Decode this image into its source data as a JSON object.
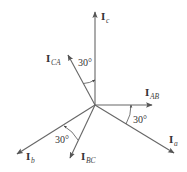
{
  "diagram": {
    "type": "phasor-diagram",
    "origin": {
      "x": 95,
      "y": 105
    },
    "line_color": "#555555",
    "phasors": [
      {
        "id": "Ic",
        "base": "I",
        "sub": "c",
        "tip": {
          "x": 95,
          "y": 12
        },
        "label_pos": {
          "x": 101,
          "y": 20
        }
      },
      {
        "id": "ICA",
        "base": "I",
        "sub": "CA",
        "tip": {
          "x": 68,
          "y": 55
        },
        "label_pos": {
          "x": 46,
          "y": 62
        }
      },
      {
        "id": "IAB",
        "base": "I",
        "sub": "AB",
        "tip": {
          "x": 152,
          "y": 105
        },
        "label_pos": {
          "x": 145,
          "y": 96
        }
      },
      {
        "id": "Ia",
        "base": "I",
        "sub": "a",
        "tip": {
          "x": 174,
          "y": 153
        },
        "label_pos": {
          "x": 169,
          "y": 143
        }
      },
      {
        "id": "Ib",
        "base": "I",
        "sub": "b",
        "tip": {
          "x": 17,
          "y": 154
        },
        "label_pos": {
          "x": 26,
          "y": 160
        }
      },
      {
        "id": "IBC",
        "base": "I",
        "sub": "BC",
        "tip": {
          "x": 70,
          "y": 158
        },
        "label_pos": {
          "x": 81,
          "y": 160
        }
      }
    ],
    "angles": [
      {
        "label": "30°",
        "between": [
          "ICA",
          "Ic"
        ],
        "label_pos": {
          "x": 78,
          "y": 66
        }
      },
      {
        "label": "30°",
        "between": [
          "Ia",
          "IAB"
        ],
        "label_pos": {
          "x": 133,
          "y": 123
        }
      },
      {
        "label": "30°",
        "between": [
          "IBC",
          "Ib"
        ],
        "label_pos": {
          "x": 55,
          "y": 143
        }
      }
    ]
  }
}
